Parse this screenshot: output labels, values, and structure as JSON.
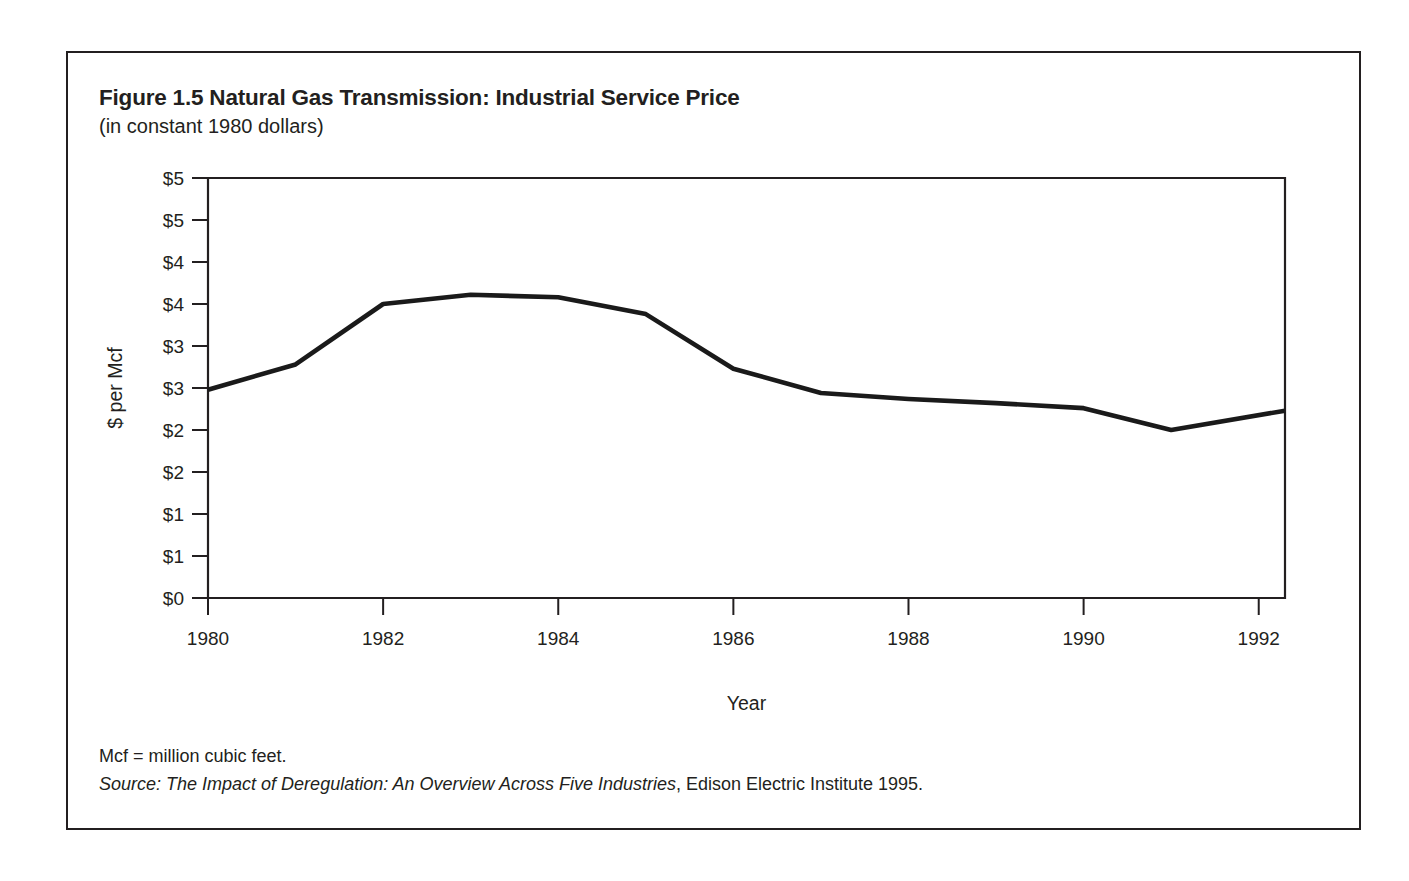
{
  "figure": {
    "title": "Figure 1.5 Natural Gas Transmission: Industrial Service Price",
    "subtitle": "(in constant 1980 dollars)",
    "footnote_units": "Mcf = million cubic feet.",
    "source_label": "Source:",
    "source_title": "The Impact of Deregulation: An Overview Across Five Industries",
    "source_rest": ", Edison Electric Institute 1995."
  },
  "chart_data": {
    "type": "line",
    "title": "Figure 1.5 Natural Gas Transmission: Industrial Service Price",
    "subtitle": "(in constant 1980 dollars)",
    "xlabel": "Year",
    "ylabel": "$ per Mcf",
    "xlim": [
      1980,
      1992.3
    ],
    "ylim": [
      0,
      5
    ],
    "grid": false,
    "legend": false,
    "x_ticks": [
      1980,
      1982,
      1984,
      1986,
      1988,
      1990,
      1992
    ],
    "x_tick_labels": [
      "1980",
      "1982",
      "1984",
      "1986",
      "1988",
      "1990",
      "1992"
    ],
    "y_ticks": [
      0,
      0.5,
      1.0,
      1.5,
      2.0,
      2.5,
      3.0,
      3.5,
      4.0,
      4.5,
      5.0
    ],
    "y_tick_labels": [
      "$0",
      "$1",
      "$1",
      "$2",
      "$2",
      "$3",
      "$3",
      "$4",
      "$4",
      "$5",
      "$5"
    ],
    "series": [
      {
        "name": "Industrial service price",
        "x": [
          1980,
          1981,
          1982,
          1983,
          1984,
          1985,
          1986,
          1987,
          1988,
          1989,
          1990,
          1991,
          1992.3
        ],
        "values": [
          2.48,
          2.78,
          3.5,
          3.61,
          3.58,
          3.38,
          2.73,
          2.44,
          2.37,
          2.32,
          2.26,
          2.0,
          2.23
        ]
      }
    ]
  }
}
